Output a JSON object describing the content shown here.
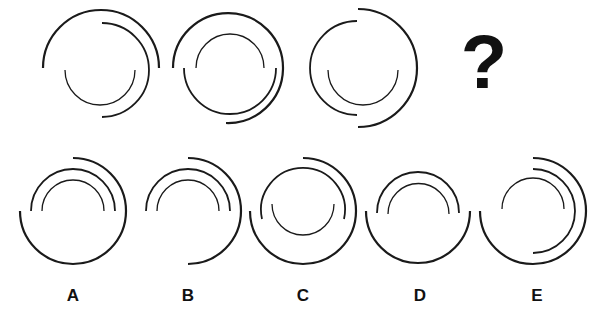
{
  "puzzle": {
    "type": "visual-sequence",
    "question_mark": "?",
    "sequence": [
      {
        "id": "seq-1",
        "arcs": [
          {
            "ring": "outer",
            "covers": "top-half",
            "d": "M 43 68 A 58 58 0 0 1 159 68"
          },
          {
            "ring": "middle",
            "covers": "right-half",
            "d": "M 102 23 A 47 47 0 0 1 102 117"
          },
          {
            "ring": "inner",
            "covers": "bottom-half",
            "d": "M 65 70 A 35 35 0 0 0 135 70"
          }
        ]
      },
      {
        "id": "seq-2",
        "arcs": [
          {
            "ring": "outer",
            "covers": "left-top-right-bottom (3/4)",
            "d": "M 173 68 A 55 55 0 1 1 226 123"
          },
          {
            "ring": "middle",
            "covers": "bottom-half",
            "d": "M 184 68 A 46 46 0 0 0 276 68"
          },
          {
            "ring": "inner",
            "covers": "top-half",
            "d": "M 196 68 A 34 34 0 0 1 264 68"
          }
        ]
      },
      {
        "id": "seq-3",
        "arcs": [
          {
            "ring": "outer",
            "covers": "right-half",
            "d": "M 358 9 A 59 59 0 0 1 358 127"
          },
          {
            "ring": "middle",
            "covers": "left-half",
            "d": "M 357 21 A 47 47 0 0 0 357 115"
          },
          {
            "ring": "inner",
            "covers": "bottom-half",
            "d": "M 328 70 A 35 35 0 0 0 398 70"
          }
        ]
      }
    ],
    "options": [
      {
        "label": "A",
        "arcs": [
          {
            "ring": "outer",
            "covers": "top-right-bottom-left (3/4)",
            "d": "M 73 158 A 53 53 0 1 1 20 211"
          },
          {
            "ring": "middle",
            "covers": "top-half",
            "d": "M 31 211 A 42 42 0 0 1 115 211"
          },
          {
            "ring": "inner",
            "covers": "top-half",
            "d": "M 42 211 A 31 31 0 0 1 104 211"
          }
        ]
      },
      {
        "label": "B",
        "arcs": [
          {
            "ring": "outer",
            "covers": "right-half",
            "d": "M 188 158 A 53 53 0 0 1 188 264"
          },
          {
            "ring": "middle",
            "covers": "top-half",
            "d": "M 146 211 A 42 42 0 0 1 230 211"
          },
          {
            "ring": "inner",
            "covers": "top-half",
            "d": "M 157 211 A 31 31 0 0 1 219 211"
          }
        ]
      },
      {
        "label": "C",
        "arcs": [
          {
            "ring": "outer",
            "covers": "top-right-bottom-left (3/4)",
            "d": "M 303 158 A 53 53 0 1 1 250 211"
          },
          {
            "ring": "middle",
            "covers": "top-half",
            "d": "M 262 219 A 42 42 0 1 1 344 219"
          },
          {
            "ring": "inner",
            "covers": "bottom-half",
            "d": "M 272 204 A 31 31 0 0 0 334 204"
          }
        ]
      },
      {
        "label": "D",
        "arcs": [
          {
            "ring": "outer",
            "covers": "bottom-half",
            "d": "M 366 211 A 52 52 0 0 0 470 211"
          },
          {
            "ring": "middle",
            "covers": "top-half",
            "d": "M 377 213 A 41 41 0 0 1 459 213"
          },
          {
            "ring": "inner",
            "covers": "top-half",
            "d": "M 388 214 A 30.5 30.5 0 0 1 449 214"
          }
        ]
      },
      {
        "label": "E",
        "arcs": [
          {
            "ring": "outer",
            "covers": "top-right-bottom-left (3/4)",
            "d": "M 533 158 A 53 53 0 1 1 480 211"
          },
          {
            "ring": "middle",
            "covers": "right-half",
            "d": "M 533 169 A 42 42 0 0 1 533 253"
          },
          {
            "ring": "inner",
            "covers": "top-half",
            "d": "M 502 209 A 31 31 0 0 1 564 209"
          }
        ]
      }
    ]
  },
  "colors": {
    "background": "#ffffff",
    "stroke": "#1a1a1a",
    "text": "#111111"
  }
}
